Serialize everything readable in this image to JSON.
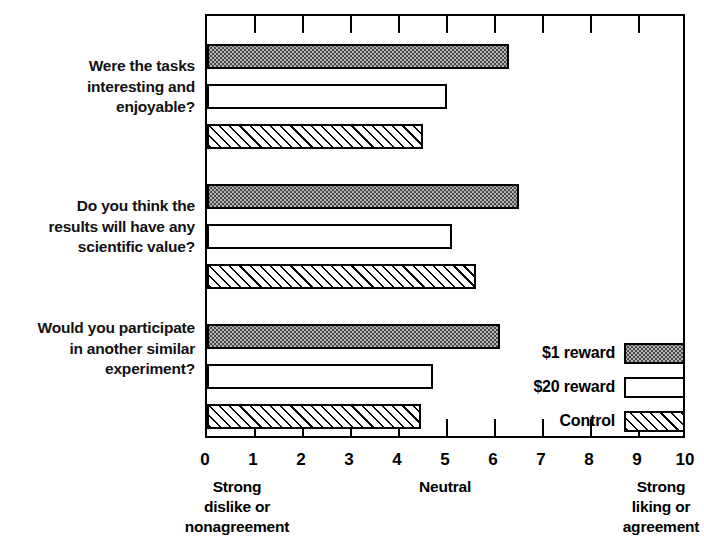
{
  "chart_data": {
    "type": "bar",
    "orientation": "horizontal",
    "title": "",
    "xlabel": "",
    "ylabel": "",
    "xlim": [
      0,
      10
    ],
    "grid": false,
    "xticks": [
      "0",
      "1",
      "2",
      "3",
      "4",
      "5",
      "6",
      "7",
      "8",
      "9",
      "10"
    ],
    "scale_anchors": {
      "left": "Strong\ndislike or\nnonagreement",
      "middle": "Neutral",
      "right": "Strong\nliking or\nagreement"
    },
    "categories": [
      "Were the tasks\ninteresting and\nenjoyable?",
      "Do you think the\nresults will have any\nscientific value?",
      "Would you participate\nin another similar\nexperiment?"
    ],
    "series": [
      {
        "name": "$1 reward",
        "fill": "stippled-grey",
        "values": [
          6.3,
          6.5,
          6.1
        ]
      },
      {
        "name": "$20 reward",
        "fill": "open-white",
        "values": [
          5.0,
          5.1,
          4.7
        ]
      },
      {
        "name": "Control",
        "fill": "diagonal-hatch",
        "values": [
          4.5,
          5.6,
          4.45
        ]
      }
    ],
    "legend_position": "inside-bottom-right"
  },
  "legend": {
    "entries": [
      {
        "label": "$1 reward"
      },
      {
        "label": "$20 reward"
      },
      {
        "label": "Control"
      }
    ]
  },
  "colors": {
    "axis": "#000000",
    "background": "#ffffff",
    "series_1_fill": "#b3b3b3",
    "series_2_fill": "#ffffff",
    "series_3_fill": "#ffffff"
  }
}
